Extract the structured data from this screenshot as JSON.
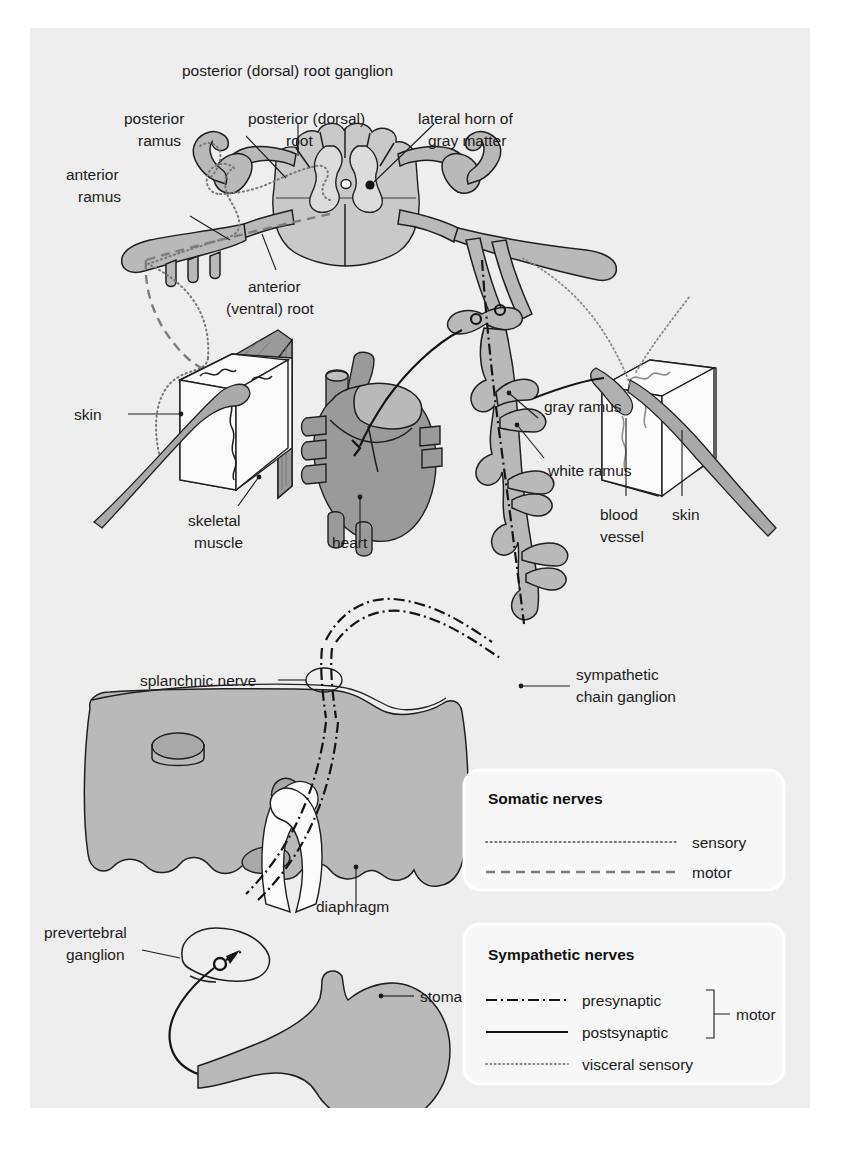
{
  "figure": {
    "domain": "anatomy-diagram",
    "title_visible": false,
    "background": "#eeeeee",
    "page_background": "#ffffff"
  },
  "labels": {
    "posterior_root_ganglion": "posterior (dorsal) root ganglion",
    "posterior_ramus": "posterior\nramus",
    "posterior_ramus_l1": "posterior",
    "posterior_ramus_l2": "ramus",
    "posterior_root_l1": "posterior (dorsal)",
    "posterior_root_l2": "root",
    "lateral_horn_l1": "lateral horn of",
    "lateral_horn_l2": "gray matter",
    "anterior_ramus_l1": "anterior",
    "anterior_ramus_l2": "ramus",
    "anterior_root_l1": "anterior",
    "anterior_root_l2": "(ventral) root",
    "skin_left": "skin",
    "skeletal_muscle_l1": "skeletal",
    "skeletal_muscle_l2": "muscle",
    "heart": "heart",
    "gray_ramus": "gray ramus",
    "white_ramus": "white ramus",
    "blood_vessel_l1": "blood",
    "blood_vessel_l2": "vessel",
    "skin_right": "skin",
    "splanchnic_nerve": "splanchnic nerve",
    "sympathetic_chain_l1": "sympathetic",
    "sympathetic_chain_l2": "chain ganglion",
    "diaphragm": "diaphragm",
    "prevertebral_l1": "prevertebral",
    "prevertebral_l2": "ganglion",
    "stomach": "stomach"
  },
  "legends": [
    {
      "id": "somatic",
      "title": "Somatic nerves",
      "entries": [
        {
          "label": "sensory",
          "style": "dotted",
          "color": "#777777"
        },
        {
          "label": "motor",
          "style": "dashed",
          "color": "#7d7d7d"
        }
      ]
    },
    {
      "id": "sympathetic",
      "title": "Sympathetic nerves",
      "bracket_label": "motor",
      "entries": [
        {
          "label": "presynaptic",
          "style": "dash-dot",
          "color": "#141414"
        },
        {
          "label": "postsynaptic",
          "style": "solid",
          "color": "#141414"
        },
        {
          "label": "visceral sensory",
          "style": "dotted",
          "color": "#8a8a8a"
        }
      ]
    }
  ],
  "colors": {
    "gray_fill": "#b9b9b9",
    "mid_fill": "#c9c9c9",
    "light_fill": "#dcdcdc",
    "white_fill": "#fbfbfb",
    "dark_fill": "#9a9a9a",
    "stroke": "#1f1f1f",
    "text": "#1b1b1b",
    "legend_box": "#f7f7f7"
  }
}
